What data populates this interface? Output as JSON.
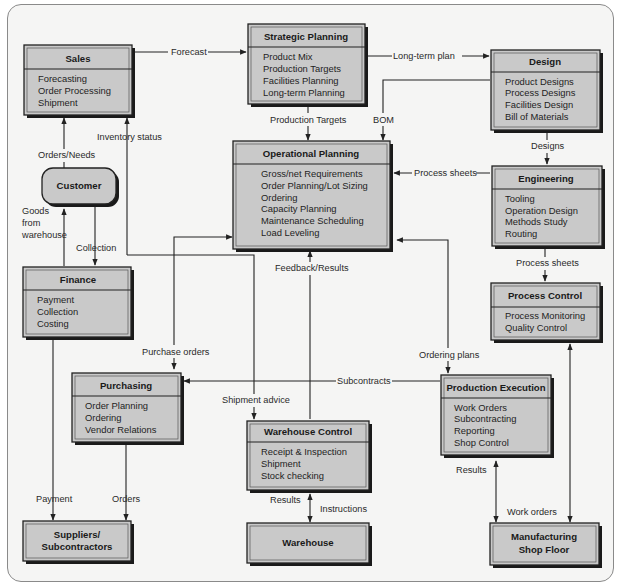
{
  "diagram": {
    "type": "flow",
    "nodes": [
      {
        "id": "sales",
        "title": "Sales",
        "items": [
          "Forecasting",
          "Order Processing",
          "Shipment"
        ]
      },
      {
        "id": "strategic",
        "title": "Strategic Planning",
        "items": [
          "Product Mix",
          "Production Targets",
          "Facilities Planning",
          "Long-term Planning"
        ]
      },
      {
        "id": "design",
        "title": "Design",
        "items": [
          "Product Designs",
          "Process Designs",
          "Facilities Design",
          "Bill of Materials"
        ]
      },
      {
        "id": "customer",
        "title": "Customer",
        "items": []
      },
      {
        "id": "operational",
        "title": "Operational Planning",
        "items": [
          "Gross/net Requirements",
          "Order Planning/Lot Sizing",
          "Ordering",
          "Capacity Planning",
          "Maintenance Scheduling",
          "Load Leveling"
        ]
      },
      {
        "id": "engineering",
        "title": "Engineering",
        "items": [
          "Tooling",
          "Operation Design",
          "Methods Study",
          "Routing"
        ]
      },
      {
        "id": "finance",
        "title": "Finance",
        "items": [
          "Payment",
          "Collection",
          "Costing"
        ]
      },
      {
        "id": "processcontrol",
        "title": "Process Control",
        "items": [
          "Process Monitoring",
          "Quality Control"
        ]
      },
      {
        "id": "purchasing",
        "title": "Purchasing",
        "items": [
          "Order Planning",
          "Ordering",
          "Vendor Relations"
        ]
      },
      {
        "id": "prodexec",
        "title": "Production Execution",
        "items": [
          "Work Orders",
          "Subcontracting",
          "Reporting",
          "Shop Control"
        ]
      },
      {
        "id": "whcontrol",
        "title": "Warehouse Control",
        "items": [
          "Receipt & Inspection",
          "Shipment",
          "Stock checking"
        ]
      },
      {
        "id": "suppliers",
        "title_lines": [
          "Suppliers/",
          "Subcontractors"
        ],
        "items": []
      },
      {
        "id": "warehouse",
        "title": "Warehouse",
        "items": []
      },
      {
        "id": "shopfloor",
        "title_lines": [
          "Manufacturing",
          "Shop Floor"
        ],
        "items": []
      }
    ],
    "edges": [
      {
        "from": "sales",
        "to": "strategic",
        "label": "Forecast"
      },
      {
        "from": "strategic",
        "to": "design",
        "label": "Long-term plan"
      },
      {
        "from": "strategic",
        "to": "operational",
        "label": "Production Targets"
      },
      {
        "from": "design",
        "to": "operational",
        "label": "BOM"
      },
      {
        "from": "design",
        "to": "engineering",
        "label": "Designs"
      },
      {
        "from": "engineering",
        "to": "operational",
        "label": "Process sheets"
      },
      {
        "from": "engineering",
        "to": "processcontrol",
        "label": "Process sheets"
      },
      {
        "from": "customer",
        "to": "sales",
        "label": "Orders/Needs"
      },
      {
        "from": "whcontrol",
        "to": "sales",
        "label": "Inventory status"
      },
      {
        "from": "finance",
        "to": "customer",
        "label": "Goods from warehouse"
      },
      {
        "from": "customer",
        "to": "finance",
        "label": "Collection"
      },
      {
        "from": "operational",
        "to": "purchasing",
        "label": "Purchase orders"
      },
      {
        "from": "whcontrol",
        "to": "operational",
        "label": "Feedback/Results"
      },
      {
        "from": "operational",
        "to": "prodexec",
        "label": "Ordering plans"
      },
      {
        "from": "prodexec",
        "to": "purchasing",
        "label": "Subcontracts"
      },
      {
        "from": "sales",
        "to": "whcontrol",
        "label": "Shipment advice"
      },
      {
        "from": "finance",
        "to": "suppliers",
        "label": "Payment"
      },
      {
        "from": "purchasing",
        "to": "suppliers",
        "label": "Orders"
      },
      {
        "from": "whcontrol",
        "to": "warehouse",
        "label": "Results / Instructions"
      },
      {
        "from": "prodexec",
        "to": "shopfloor",
        "label": "Results / Work orders"
      },
      {
        "from": "processcontrol",
        "to": "shopfloor",
        "label": "bidirectional"
      }
    ]
  },
  "labels": {
    "forecast": "Forecast",
    "long_term_plan": "Long-term plan",
    "production_targets": "Production Targets",
    "bom": "BOM",
    "designs": "Designs",
    "process_sheets_1": "Process sheets",
    "process_sheets_2": "Process sheets",
    "inventory_status": "Inventory status",
    "orders_needs": "Orders/Needs",
    "goods_1": "Goods",
    "goods_2": "from",
    "goods_3": "warehouse",
    "collection": "Collection",
    "feedback_results": "Feedback/Results",
    "purchase_orders": "Purchase orders",
    "ordering_plans": "Ordering plans",
    "subcontracts": "Subcontracts",
    "shipment_advice": "Shipment advice",
    "payment": "Payment",
    "orders": "Orders",
    "results_wh": "Results",
    "instructions": "Instructions",
    "results_pe": "Results",
    "work_orders": "Work orders"
  },
  "colors": {
    "box_fill": "#c9c9c9",
    "background": "#f5f5f4",
    "line": "#222222"
  }
}
